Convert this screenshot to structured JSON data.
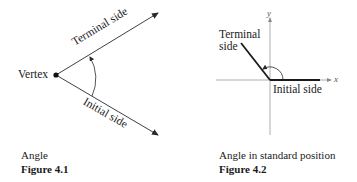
{
  "figures": [
    {
      "id": "4.1",
      "caption": "Angle",
      "figure_label": "Figure 4.1",
      "labels": {
        "vertex": "Vertex",
        "terminal_side": "Terminal side",
        "initial_side": "Initial side"
      }
    },
    {
      "id": "4.2",
      "caption": "Angle in standard position",
      "figure_label": "Figure 4.2",
      "labels": {
        "terminal_side_line1": "Terminal",
        "terminal_side_line2": "side",
        "initial_side": "Initial side",
        "x_axis": "x",
        "y_axis": "y"
      }
    }
  ],
  "colors": {
    "line": "#2a2a2a",
    "axis": "#9a9a9a",
    "text": "#1a1a1a"
  }
}
